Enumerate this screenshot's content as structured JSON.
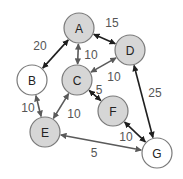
{
  "diagram": {
    "type": "weighted-undirected-graph",
    "colors": {
      "node_fill_visited": "#d6d6d6",
      "node_fill_unvisited": "#ffffff",
      "node_stroke": "#7a7a7a",
      "edge_dark": "#1f1f1f",
      "edge_gray": "#5a5a5a",
      "label_color": "#555555"
    },
    "nodes": [
      {
        "id": "A",
        "label": "A",
        "x": 79,
        "y": 28,
        "r": 15,
        "fill": "#d6d6d6"
      },
      {
        "id": "B",
        "label": "B",
        "x": 32,
        "y": 80,
        "r": 15,
        "fill": "#ffffff"
      },
      {
        "id": "C",
        "label": "C",
        "x": 77,
        "y": 80,
        "r": 15,
        "fill": "#d6d6d6"
      },
      {
        "id": "D",
        "label": "D",
        "x": 130,
        "y": 50,
        "r": 15,
        "fill": "#d6d6d6"
      },
      {
        "id": "E",
        "label": "E",
        "x": 45,
        "y": 132,
        "r": 15,
        "fill": "#d6d6d6"
      },
      {
        "id": "F",
        "label": "F",
        "x": 113,
        "y": 111,
        "r": 15,
        "fill": "#d6d6d6"
      },
      {
        "id": "G",
        "label": "G",
        "x": 157,
        "y": 153,
        "r": 15,
        "fill": "#ffffff"
      }
    ],
    "edges": [
      {
        "from": "A",
        "to": "B",
        "weight": "20",
        "color": "#1f1f1f",
        "label_x": 40,
        "label_y": 50
      },
      {
        "from": "A",
        "to": "D",
        "weight": "15",
        "color": "#1f1f1f",
        "label_x": 112,
        "label_y": 27
      },
      {
        "from": "A",
        "to": "C",
        "weight": "10",
        "color": "#5a5a5a",
        "label_x": 91,
        "label_y": 59
      },
      {
        "from": "C",
        "to": "D",
        "weight": "10",
        "color": "#5a5a5a",
        "label_x": 114,
        "label_y": 81
      },
      {
        "from": "C",
        "to": "F",
        "weight": "5",
        "color": "#1f1f1f",
        "label_x": 99,
        "label_y": 94
      },
      {
        "from": "C",
        "to": "E",
        "weight": "10",
        "color": "#5a5a5a",
        "label_x": 74,
        "label_y": 118
      },
      {
        "from": "B",
        "to": "E",
        "weight": "10",
        "color": "#5a5a5a",
        "label_x": 28,
        "label_y": 112
      },
      {
        "from": "D",
        "to": "G",
        "weight": "25",
        "color": "#1f1f1f",
        "label_x": 155,
        "label_y": 97
      },
      {
        "from": "F",
        "to": "G",
        "weight": "10",
        "color": "#1f1f1f",
        "label_x": 126,
        "label_y": 141
      },
      {
        "from": "E",
        "to": "G",
        "weight": "5",
        "color": "#5a5a5a",
        "label_x": 94,
        "label_y": 157
      }
    ]
  }
}
